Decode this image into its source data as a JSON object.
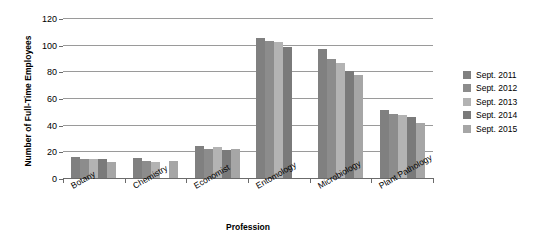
{
  "chart_data": {
    "type": "bar",
    "title": "",
    "xlabel": "Profession",
    "ylabel": "Number of Full-Time Employees",
    "ylim": [
      0,
      120
    ],
    "yticks": [
      0,
      20,
      40,
      60,
      80,
      100,
      120
    ],
    "grid": true,
    "legend_position": "right",
    "categories": [
      "Botany",
      "Chemistry",
      "Economist",
      "Entomology",
      "Microbiology",
      "Plant Pathology"
    ],
    "series": [
      {
        "name": "Sept. 2011",
        "color": "#808080",
        "values": [
          16,
          15,
          24,
          105,
          97,
          51
        ]
      },
      {
        "name": "Sept. 2012",
        "color": "#8c8c8c",
        "values": [
          14,
          13,
          22,
          103,
          89,
          48
        ]
      },
      {
        "name": "Sept. 2013",
        "color": "#b3b3b3",
        "values": [
          14,
          12,
          23,
          102,
          86,
          47
        ]
      },
      {
        "name": "Sept. 2014",
        "color": "#7a7a7a",
        "values": [
          14,
          0,
          21,
          98,
          80,
          46
        ]
      },
      {
        "name": "Sept. 2015",
        "color": "#a6a6a6",
        "values": [
          12,
          13,
          22,
          0,
          77,
          41
        ]
      }
    ]
  },
  "axes": {
    "y_title": "Number of Full-Time Employees",
    "x_title": "Profession",
    "y_tick_labels": [
      "120",
      "100",
      "80",
      "60",
      "40",
      "20",
      "0"
    ]
  },
  "legend": {
    "items": [
      {
        "label": "Sept. 2011"
      },
      {
        "label": "Sept. 2012"
      },
      {
        "label": "Sept. 2013"
      },
      {
        "label": "Sept. 2014"
      },
      {
        "label": "Sept. 2015"
      }
    ]
  }
}
